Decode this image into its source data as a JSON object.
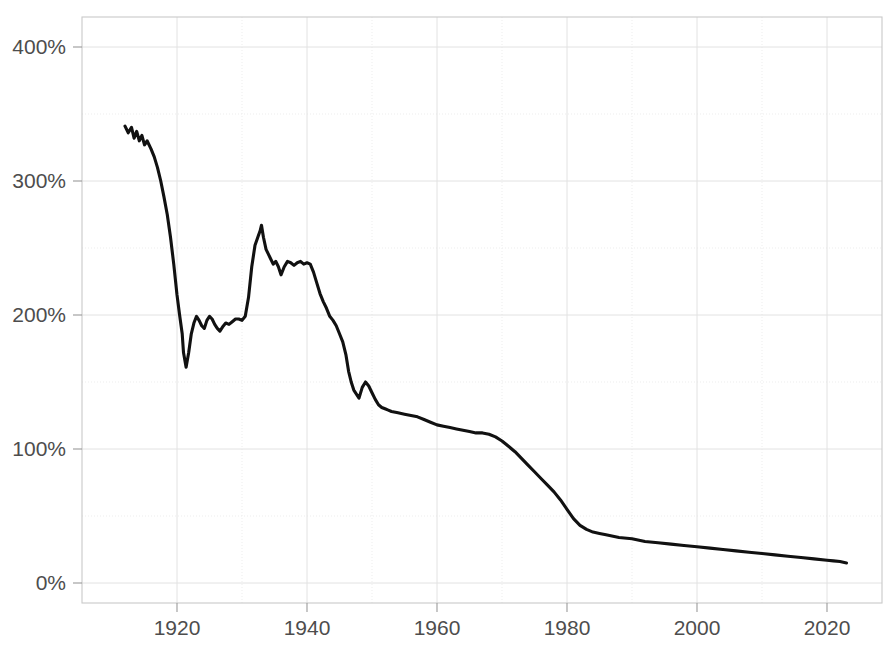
{
  "chart_data": {
    "type": "line",
    "title": "",
    "subtitle": "",
    "xlabel": "",
    "ylabel": "",
    "xlim": [
      1911,
      2024
    ],
    "ylim": [
      0,
      420
    ],
    "grid": true,
    "legend_position": "none",
    "y_tick_labels": [
      "0%",
      "100%",
      "200%",
      "300%",
      "400%"
    ],
    "y_tick_values": [
      0,
      100,
      200,
      300,
      400
    ],
    "y_minor_tick_values": [
      50,
      150,
      250,
      350
    ],
    "x_tick_labels": [
      "1920",
      "1940",
      "1960",
      "1980",
      "2000",
      "2020"
    ],
    "x_tick_values": [
      1920,
      1940,
      1960,
      1980,
      2000,
      2020
    ],
    "x_minor_tick_values": [
      1930,
      1950,
      1970,
      1990,
      2010
    ],
    "series": [
      {
        "name": "series-1",
        "color": "#111111",
        "x": [
          1912,
          1912.5,
          1913,
          1913.4,
          1913.8,
          1914.2,
          1914.6,
          1915,
          1915.4,
          1916,
          1916.5,
          1917,
          1917.5,
          1918,
          1918.5,
          1919,
          1919.5,
          1920,
          1920.4,
          1920.8,
          1921,
          1921.4,
          1921.8,
          1922.2,
          1922.6,
          1923,
          1923.4,
          1923.8,
          1924.2,
          1924.6,
          1925,
          1925.4,
          1925.8,
          1926.2,
          1926.6,
          1927,
          1927.5,
          1928,
          1928.5,
          1929,
          1929.5,
          1930,
          1930.5,
          1931,
          1931.5,
          1932,
          1932.5,
          1932.8,
          1933,
          1933.3,
          1933.7,
          1934,
          1934.4,
          1934.8,
          1935.2,
          1935.6,
          1936,
          1936.5,
          1937,
          1937.5,
          1938,
          1938.5,
          1939,
          1939.5,
          1940,
          1940.5,
          1941,
          1941.5,
          1942,
          1942.5,
          1943,
          1943.5,
          1944,
          1944.5,
          1945,
          1945.5,
          1946,
          1946.4,
          1946.8,
          1947.2,
          1947.6,
          1948,
          1948.5,
          1949,
          1949.5,
          1950,
          1950.5,
          1951,
          1951.5,
          1952,
          1952.5,
          1953,
          1954,
          1955,
          1956,
          1957,
          1958,
          1959,
          1960,
          1961,
          1962,
          1963,
          1964,
          1965,
          1966,
          1967,
          1968,
          1969,
          1970,
          1971,
          1972,
          1973,
          1974,
          1975,
          1976,
          1977,
          1978,
          1979,
          1980,
          1981,
          1982,
          1983,
          1984,
          1985,
          1986,
          1988,
          1990,
          1992,
          1994,
          1996,
          1998,
          2000,
          2002,
          2004,
          2006,
          2008,
          2010,
          2012,
          2014,
          2016,
          2018,
          2020,
          2021,
          2022,
          2023
        ],
        "y": [
          341,
          336,
          340,
          332,
          337,
          330,
          334,
          327,
          330,
          324,
          318,
          310,
          300,
          288,
          275,
          258,
          238,
          215,
          200,
          186,
          172,
          161,
          172,
          186,
          194,
          199,
          196,
          192,
          190,
          196,
          199,
          197,
          193,
          190,
          188,
          191,
          194,
          193,
          195,
          197,
          197,
          196,
          199,
          213,
          236,
          252,
          259,
          263,
          267,
          258,
          249,
          246,
          242,
          238,
          240,
          236,
          230,
          236,
          240,
          239,
          237,
          239,
          240,
          238,
          239,
          238,
          232,
          224,
          216,
          210,
          205,
          199,
          196,
          192,
          186,
          180,
          170,
          158,
          150,
          144,
          141,
          138,
          146,
          150,
          147,
          142,
          137,
          133,
          131,
          130,
          129,
          128,
          127,
          126,
          125,
          124,
          122,
          120,
          118,
          117,
          116,
          115,
          114,
          113,
          112,
          112,
          111,
          109,
          106,
          102,
          98,
          93,
          88,
          83,
          78,
          73,
          68,
          62,
          55,
          48,
          43,
          40,
          38,
          37,
          36,
          34,
          33,
          31,
          30,
          29,
          28,
          27,
          26,
          25,
          24,
          23,
          22,
          21,
          20,
          19,
          18,
          17,
          16.5,
          16,
          15
        ]
      }
    ]
  }
}
